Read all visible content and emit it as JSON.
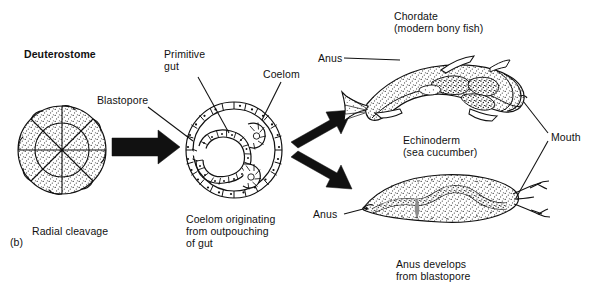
{
  "figure": {
    "panel_label": "(b)",
    "title": "Deuterostome",
    "background_color": "#ffffff",
    "ink_color": "#111111",
    "stipple_color": "#4a4a4a"
  },
  "stages": {
    "embryo": {
      "caption": "Radial cleavage",
      "segments": 8
    },
    "gastrula": {
      "caption_line1": "Coelom originating",
      "caption_line2": "from outpouching",
      "caption_line3": "of gut",
      "labels": {
        "blastopore": "Blastopore",
        "primitive_gut_line1": "Primitive",
        "primitive_gut_line2": "gut",
        "coelom": "Coelom"
      }
    }
  },
  "outcomes": {
    "chordate": {
      "name_line1": "Chordate",
      "name_line2": "(modern bony fish)",
      "anus_label": "Anus"
    },
    "echinoderm": {
      "name_line1": "Echinoderm",
      "name_line2": "(sea cucumber)",
      "anus_label": "Anus",
      "caption_line1": "Anus develops",
      "caption_line2": "from blastopore"
    },
    "shared_mouth_label": "Mouth"
  }
}
